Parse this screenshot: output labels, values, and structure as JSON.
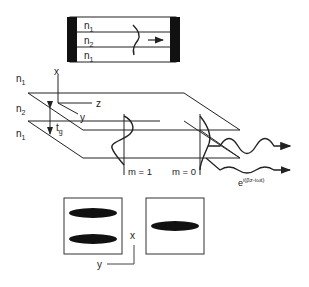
{
  "top_waveguide": {
    "layers": [
      {
        "label": "n",
        "sub": "1"
      },
      {
        "label": "n",
        "sub": "2"
      },
      {
        "label": "n",
        "sub": "1"
      }
    ],
    "arrow": "propagation-arrow"
  },
  "slab": {
    "layers": [
      {
        "label": "n",
        "sub": "1"
      },
      {
        "label": "n",
        "sub": "2"
      },
      {
        "label": "n",
        "sub": "1"
      }
    ],
    "thickness": {
      "label": "t",
      "sub": "g"
    },
    "axes": {
      "x": "x",
      "y": "y",
      "z": "z"
    },
    "modes": [
      {
        "label": "m = 1"
      },
      {
        "label": "m = 0"
      }
    ],
    "wave_expression": {
      "base": "e",
      "exponent": "i(βz-iωt)"
    }
  },
  "mode_profiles": {
    "axes": {
      "x": "x",
      "y": "y"
    },
    "panels": [
      {
        "name": "m=1 profile",
        "lobes": 2
      },
      {
        "name": "m=0 profile",
        "lobes": 1
      }
    ]
  },
  "colors": {
    "line": "#222222",
    "fill_dark": "#111111",
    "background": "#ffffff"
  }
}
